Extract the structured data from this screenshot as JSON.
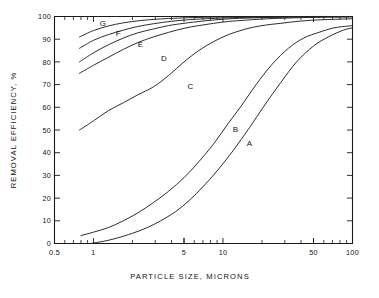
{
  "chart_data": {
    "type": "line",
    "title": "",
    "xlabel": "PARTICLE  SIZE, MICRONS",
    "ylabel": "REMOVAL  EFFICIENCY, %",
    "xscale": "log",
    "yscale": "linear",
    "xlim": [
      0.5,
      100
    ],
    "ylim": [
      0,
      100
    ],
    "grid": false,
    "legend": "inline-curve-labels",
    "xticks": [
      0.5,
      1,
      5,
      10,
      50,
      100
    ],
    "xtick_labels": [
      "0.5",
      "1",
      "5",
      "10",
      "50",
      "100"
    ],
    "yticks": [
      0,
      10,
      20,
      30,
      40,
      50,
      60,
      70,
      80,
      90,
      100
    ],
    "ytick_labels": [
      "0",
      "10",
      "20",
      "30",
      "40",
      "50",
      "60",
      "70",
      "80",
      "90",
      "100"
    ],
    "series": [
      {
        "name": "A",
        "label": "A",
        "label_x": 16.0,
        "label_y": 43.0,
        "x": [
          0.95,
          1.2,
          1.5,
          2.0,
          2.6,
          3.3,
          4.3,
          5.5,
          7.0,
          9.0,
          12.0,
          16.0,
          21.0,
          28.0,
          37.0,
          50.0,
          65.0,
          85.0,
          100.0
        ],
        "y": [
          0.0,
          1.0,
          2.3,
          4.5,
          7.0,
          10.0,
          14.0,
          19.0,
          25.0,
          32.0,
          41.0,
          51.0,
          61.0,
          71.0,
          80.0,
          87.0,
          91.0,
          94.0,
          95.0
        ]
      },
      {
        "name": "B",
        "label": "B",
        "label_x": 12.5,
        "label_y": 49.0,
        "x": [
          0.8,
          1.0,
          1.3,
          1.7,
          2.2,
          2.9,
          3.8,
          5.0,
          6.5,
          8.5,
          11.0,
          14.0,
          18.0,
          24.0,
          32.0,
          42.0,
          55.0,
          72.0,
          100.0
        ],
        "y": [
          3.5,
          5.0,
          7.0,
          10.0,
          13.5,
          18.0,
          23.0,
          29.0,
          36.0,
          44.0,
          53.0,
          61.0,
          70.0,
          79.0,
          86.0,
          90.5,
          93.0,
          95.0,
          96.0
        ]
      },
      {
        "name": "C",
        "label": "C",
        "label_x": 5.6,
        "label_y": 68.0,
        "x": [
          0.78,
          1.0,
          1.3,
          1.7,
          2.2,
          2.9,
          3.8,
          5.0,
          6.5,
          8.5,
          11.0,
          15.0,
          20.0,
          28.0,
          40.0,
          60.0,
          100.0
        ],
        "y": [
          50.0,
          54.0,
          58.5,
          62.0,
          65.5,
          69.0,
          74.0,
          80.0,
          85.0,
          89.0,
          92.0,
          94.5,
          96.0,
          97.0,
          98.0,
          98.6,
          99.0
        ]
      },
      {
        "name": "D",
        "label": "D",
        "label_x": 3.5,
        "label_y": 80.5,
        "x": [
          0.78,
          1.0,
          1.3,
          1.7,
          2.2,
          2.9,
          3.8,
          5.0,
          6.5,
          8.5,
          11.0,
          15.0,
          22.0,
          35.0,
          60.0,
          100.0
        ],
        "y": [
          75.0,
          78.5,
          82.0,
          85.5,
          88.5,
          91.0,
          93.0,
          94.8,
          96.0,
          97.0,
          97.8,
          98.4,
          99.0,
          99.4,
          99.7,
          99.8
        ]
      },
      {
        "name": "E",
        "label": "E",
        "label_x": 2.3,
        "label_y": 86.5,
        "x": [
          0.78,
          1.0,
          1.3,
          1.7,
          2.2,
          2.9,
          3.8,
          5.0,
          7.0,
          10.0,
          15.0,
          25.0,
          45.0,
          100.0
        ],
        "y": [
          80.0,
          84.0,
          87.5,
          90.5,
          92.8,
          94.5,
          96.0,
          97.0,
          98.0,
          98.8,
          99.3,
          99.6,
          99.8,
          99.9
        ]
      },
      {
        "name": "F",
        "label": "F",
        "label_x": 1.55,
        "label_y": 91.5,
        "x": [
          0.78,
          1.0,
          1.3,
          1.7,
          2.2,
          2.9,
          4.0,
          5.5,
          8.0,
          12.0,
          20.0,
          40.0,
          100.0
        ],
        "y": [
          86.0,
          89.5,
          92.0,
          94.0,
          95.6,
          96.8,
          97.9,
          98.6,
          99.1,
          99.5,
          99.7,
          99.9,
          100.0
        ]
      },
      {
        "name": "G",
        "label": "G",
        "label_x": 1.18,
        "label_y": 96.0,
        "x": [
          0.78,
          1.0,
          1.3,
          1.7,
          2.3,
          3.2,
          4.5,
          6.5,
          10.0,
          18.0,
          40.0,
          100.0
        ],
        "y": [
          91.0,
          93.8,
          95.8,
          97.2,
          98.2,
          98.9,
          99.3,
          99.6,
          99.8,
          99.9,
          100.0,
          100.0
        ]
      }
    ]
  },
  "colors": {
    "axis": "#1a1a1a",
    "curve": "#222222",
    "background": "#ffffff"
  }
}
